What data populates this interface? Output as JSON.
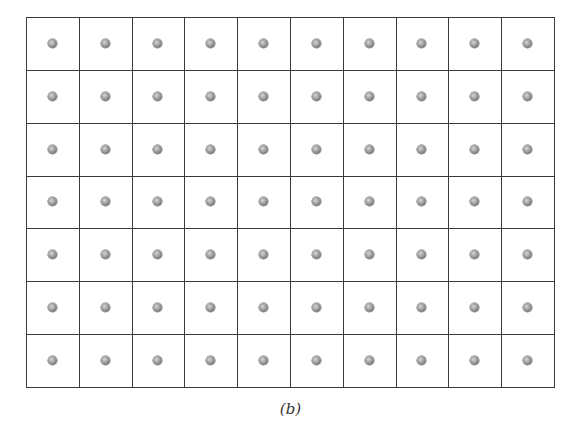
{
  "figure": {
    "caption": "(b)",
    "grid": {
      "columns": 10,
      "rows": 7
    },
    "colors": {
      "lines": "#3a3a3a",
      "atom": "#8a8a8a",
      "background": "#ffffff"
    }
  }
}
